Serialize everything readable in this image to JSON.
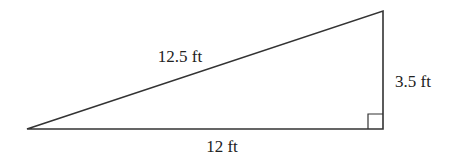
{
  "diagram": {
    "type": "right-triangle",
    "labels": {
      "hypotenuse": "12.5 ft",
      "height": "3.5 ft",
      "base": "12 ft"
    },
    "right_angle_marker": true,
    "stroke_color": "#333333"
  }
}
